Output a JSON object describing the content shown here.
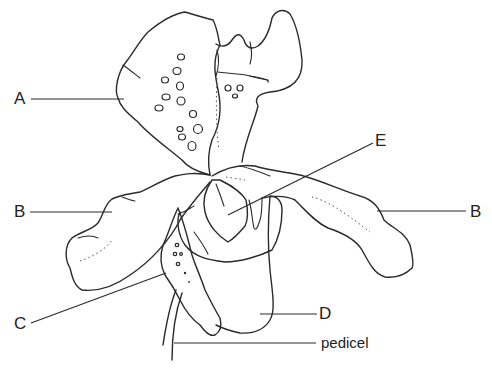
{
  "diagram": {
    "labels": {
      "A": "A",
      "B_left": "B",
      "B_right": "B",
      "C": "C",
      "D": "D",
      "E": "E",
      "pedicel": "pedicel"
    },
    "colors": {
      "line": "#2a2a2a",
      "background": "#ffffff"
    }
  }
}
